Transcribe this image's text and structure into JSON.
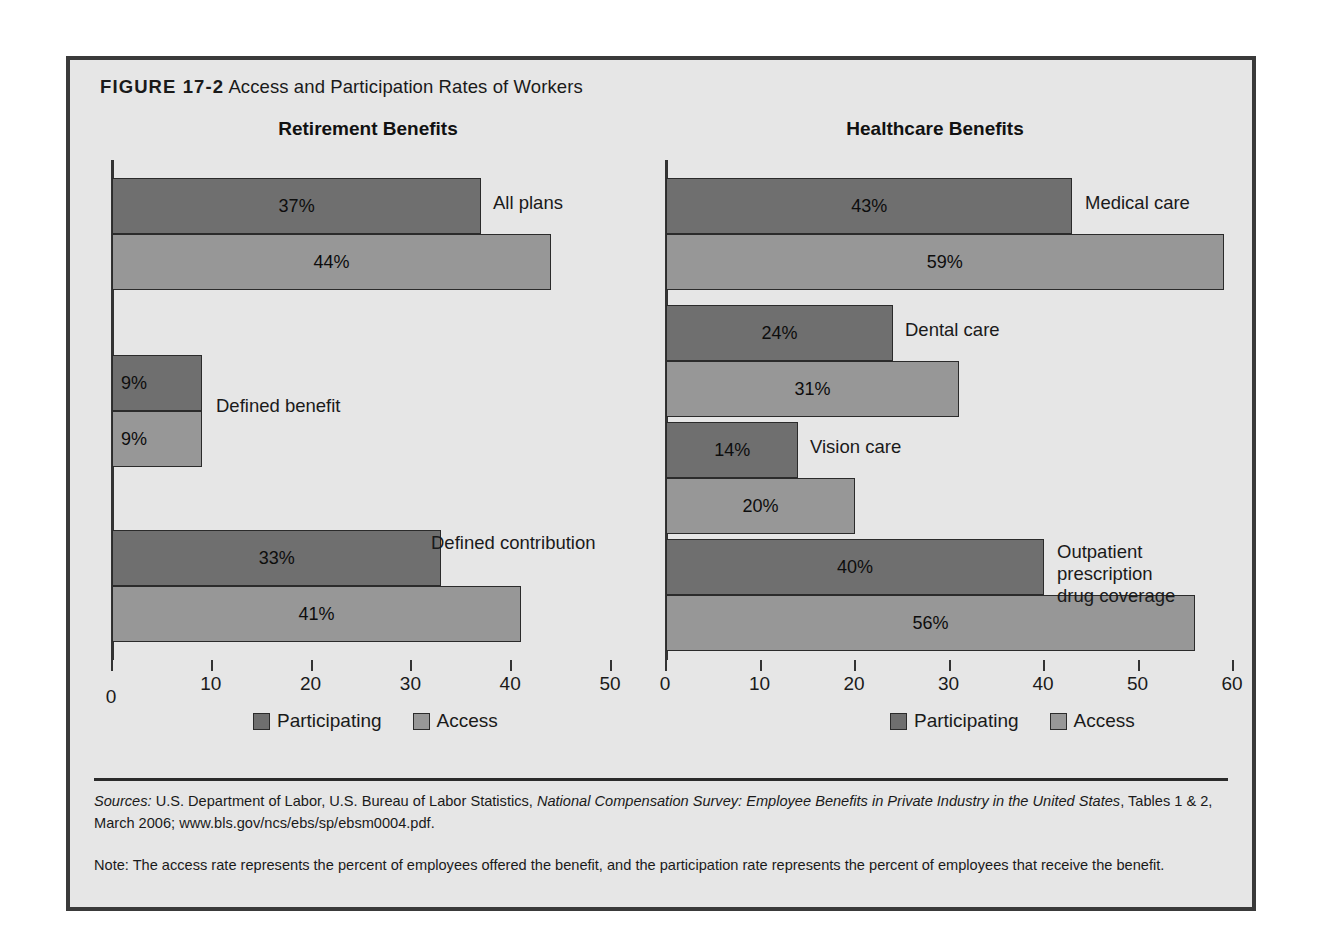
{
  "figure": {
    "label": "FIGURE 17-2",
    "title": "Access and Participation Rates of Workers"
  },
  "legend": {
    "participating": "Participating",
    "access": "Access",
    "colors": {
      "participating": "#6f6f6f",
      "access": "#979797"
    }
  },
  "footer": {
    "sources_prefix": "Sources:",
    "sources_text_1": " U.S. Department of Labor, U.S. Bureau of Labor Statistics, ",
    "sources_italic": "National Compensation Survey: Employee Benefits in Private Industry in the United States",
    "sources_text_2": ", Tables 1 & 2, March 2006; www.bls.gov/ncs/ebs/sp/ebsm0004.pdf.",
    "note": "Note: The access rate represents the percent of employees offered the benefit, and the participation rate represents the percent of employees that receive the benefit."
  },
  "chart_data": [
    {
      "type": "bar",
      "title": "Retirement Benefits",
      "orientation": "horizontal",
      "xlabel": "",
      "ylabel": "",
      "xlim": [
        0,
        50
      ],
      "xticks": [
        0,
        10,
        20,
        30,
        40,
        50
      ],
      "xtick_labels": [
        "0",
        "10",
        "20",
        "30",
        "40",
        "50"
      ],
      "grid": false,
      "legend_position": "bottom",
      "categories": [
        "All plans",
        "Defined benefit",
        "Defined contribution"
      ],
      "series": [
        {
          "name": "Participating",
          "values": [
            37,
            9,
            33
          ],
          "labels": [
            "37%",
            "9%",
            "33%"
          ]
        },
        {
          "name": "Access",
          "values": [
            44,
            9,
            41
          ],
          "labels": [
            "44%",
            "9%",
            "41%"
          ]
        }
      ]
    },
    {
      "type": "bar",
      "title": "Healthcare Benefits",
      "orientation": "horizontal",
      "xlabel": "",
      "ylabel": "",
      "xlim": [
        0,
        60
      ],
      "xticks": [
        0,
        10,
        20,
        30,
        40,
        50,
        60
      ],
      "xtick_labels": [
        "0",
        "10",
        "20",
        "30",
        "40",
        "50",
        "60"
      ],
      "grid": false,
      "legend_position": "bottom",
      "categories": [
        "Medical care",
        "Dental care",
        "Vision care",
        "Outpatient prescription\ndrug coverage"
      ],
      "series": [
        {
          "name": "Participating",
          "values": [
            43,
            24,
            14,
            40
          ],
          "labels": [
            "43%",
            "24%",
            "14%",
            "40%"
          ]
        },
        {
          "name": "Access",
          "values": [
            59,
            31,
            20,
            56
          ],
          "labels": [
            "59%",
            "31%",
            "20%",
            "56%"
          ]
        }
      ]
    }
  ]
}
